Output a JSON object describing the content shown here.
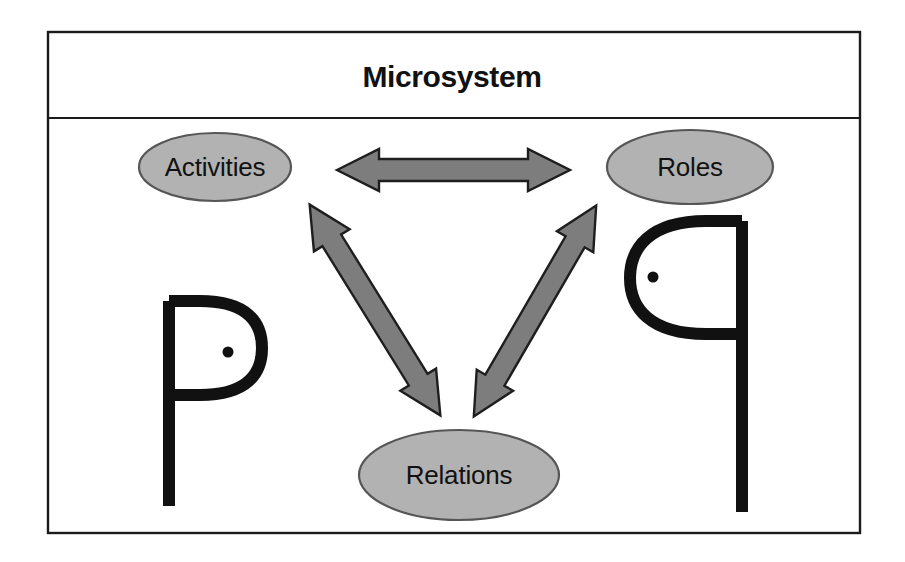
{
  "figure": {
    "title": "Microsystem",
    "frame": {
      "x": 48,
      "y": 32,
      "width": 812,
      "height": 501,
      "header_divider_y": 118
    },
    "colors": {
      "background": "#ffffff",
      "frame_stroke": "#1b1b1b",
      "node_fill": "#b2b2b2",
      "node_stroke": "#565656",
      "arrow_fill": "#7d7d7d",
      "arrow_stroke": "#1e1e1e",
      "figure_stroke": "#111111",
      "text": "#111111"
    },
    "nodes": [
      {
        "id": "activities",
        "label": "Activities",
        "cx": 215,
        "cy": 167,
        "rx": 76,
        "ry": 34
      },
      {
        "id": "roles",
        "label": "Roles",
        "cx": 690,
        "cy": 167,
        "rx": 83,
        "ry": 37
      },
      {
        "id": "relations",
        "label": "Relations",
        "cx": 459,
        "cy": 475,
        "rx": 100,
        "ry": 45
      }
    ],
    "arrows": [
      {
        "id": "activities-roles",
        "from": "activities",
        "to": "roles",
        "direction": "bidirectional",
        "orientation": "horizontal"
      },
      {
        "id": "activities-relations",
        "from": "activities",
        "to": "relations",
        "direction": "bidirectional",
        "orientation": "diagonal-down-right"
      },
      {
        "id": "relations-roles",
        "from": "relations",
        "to": "roles",
        "direction": "bidirectional",
        "orientation": "diagonal-up-right"
      }
    ],
    "person_figures": [
      {
        "id": "person-left",
        "facing": "right",
        "description": "stylized P person figure"
      },
      {
        "id": "person-right",
        "facing": "left",
        "description": "stylized q person figure"
      }
    ]
  }
}
